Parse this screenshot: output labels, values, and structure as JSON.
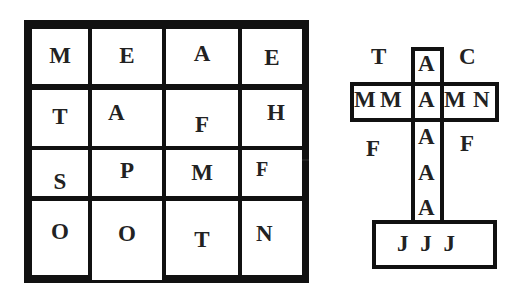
{
  "grid": {
    "rows": [
      [
        "M",
        "E",
        "A",
        "E"
      ],
      [
        "T",
        "A",
        "F",
        "H"
      ],
      [
        "S",
        "P",
        "M",
        "F"
      ],
      [
        "O",
        "O",
        "T",
        "N"
      ]
    ]
  },
  "cross": {
    "top_left": "T",
    "top_center": "A",
    "top_right": "C",
    "horizontal": [
      "M",
      "M",
      "A",
      "M",
      "N"
    ],
    "mid_left": "F",
    "mid_right": "F",
    "vertical_lower": [
      "A",
      "A",
      "A"
    ],
    "base": "J J J"
  }
}
